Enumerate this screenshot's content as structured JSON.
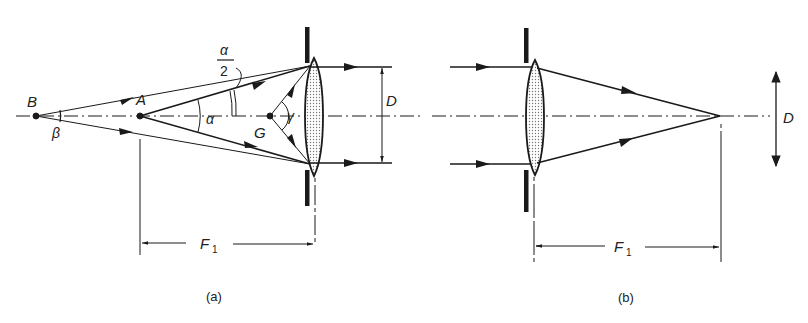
{
  "figure": {
    "panel_a": {
      "caption": "(a)",
      "points": {
        "B": "B",
        "A": "A",
        "G": "G"
      },
      "angles": {
        "beta": "β",
        "alpha": "α",
        "alpha_half_num": "α",
        "alpha_half_den": "2",
        "gamma": "γ"
      },
      "dimension_D": "D",
      "focal_length": "F",
      "focal_sub": "1"
    },
    "panel_b": {
      "caption": "(b)",
      "dimension_D": "D",
      "focal_length": "F",
      "focal_sub": "1"
    },
    "colors": {
      "ink": "#1a1a1a",
      "lens_fill": "#d8d8d8",
      "background": "#ffffff"
    }
  }
}
